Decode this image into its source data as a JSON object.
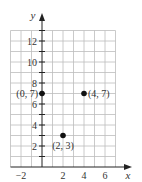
{
  "chart_data": {
    "type": "scatter",
    "title": "",
    "xlabel": "x",
    "ylabel": "y",
    "xlim": [
      -3,
      7
    ],
    "ylim": [
      0,
      13
    ],
    "grid": true,
    "x_ticks": [
      -2,
      2,
      4,
      6
    ],
    "y_ticks": [
      2,
      4,
      6,
      8,
      10,
      12
    ],
    "points": [
      {
        "x": 0,
        "y": 7,
        "label": "(0, 7)",
        "label_position": "left"
      },
      {
        "x": 4,
        "y": 7,
        "label": "(4, 7)",
        "label_position": "right"
      },
      {
        "x": 2,
        "y": 3,
        "label": "(2, 3)",
        "label_position": "below"
      }
    ],
    "legend": null
  },
  "colors": {
    "grid": "#bdbdbd",
    "axis": "#222222",
    "point": "#111111",
    "text": "#333333"
  },
  "labels": {
    "x_axis": "x",
    "y_axis": "y",
    "x_tick_labels": [
      "−2",
      "2",
      "4",
      "6"
    ],
    "y_tick_labels": [
      "2",
      "4",
      "6",
      "8",
      "10",
      "12"
    ],
    "point_0": "(0, 7)",
    "point_1": "(4, 7)",
    "point_2": "(2, 3)"
  }
}
